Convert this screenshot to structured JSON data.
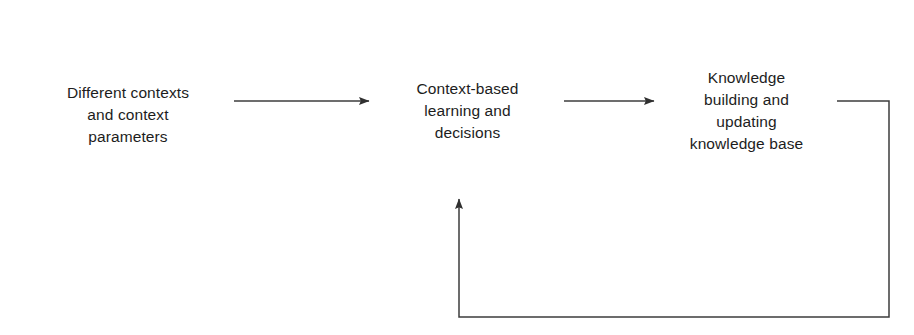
{
  "diagram": {
    "type": "flowchart",
    "orientation": "left-to-right-with-feedback-loop",
    "background_color": "#ffffff",
    "line_color": "#3c3c3c",
    "text_color": "#1d1d1d",
    "nodes": [
      {
        "id": "contexts",
        "label": "Different contexts\nand context\nparameters",
        "shape": "rectangle"
      },
      {
        "id": "learning",
        "label": "Context-based\nlearning and\ndecisions",
        "shape": "rectangle"
      },
      {
        "id": "knowledge",
        "label": "Knowledge\nbuilding and\nupdating\nknowledge base",
        "shape": "rectangle"
      }
    ],
    "edges": [
      {
        "id": "contexts-to-learning",
        "from": "contexts",
        "to": "learning",
        "style": "straight",
        "arrowhead": "filled-triangle",
        "label": ""
      },
      {
        "id": "learning-to-knowledge",
        "from": "learning",
        "to": "knowledge",
        "style": "straight",
        "arrowhead": "filled-triangle",
        "label": ""
      },
      {
        "id": "knowledge-to-learning-feedback",
        "from": "knowledge",
        "to": "learning",
        "style": "orthogonal-feedback",
        "arrowhead": "filled-triangle",
        "label": ""
      }
    ]
  }
}
